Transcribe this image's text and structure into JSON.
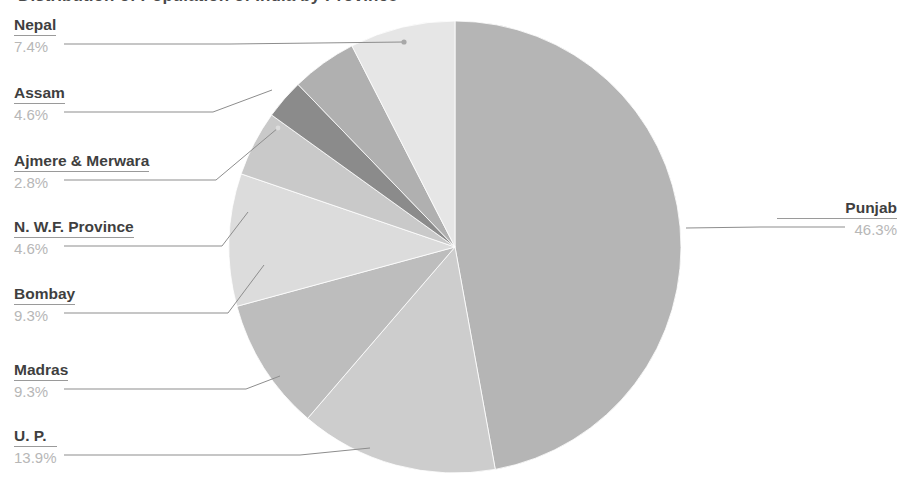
{
  "chart_data": {
    "type": "pie",
    "title": "Distribution of Population of India by Province",
    "xlabel": "",
    "ylabel": "",
    "legend_position": "none",
    "grid": false,
    "start_angle_deg": 0,
    "direction": "clockwise",
    "categories": [
      "Punjab",
      "U. P.",
      "Madras",
      "Bombay",
      "N. W.F. Province",
      "Ajmere & Merwara",
      "Assam",
      "Nepal"
    ],
    "values": [
      46.3,
      13.9,
      9.3,
      9.3,
      4.6,
      2.8,
      4.6,
      7.4
    ],
    "value_labels": [
      "46.3%",
      "13.9%",
      "9.3%",
      "9.3%",
      "4.6%",
      "2.8%",
      "4.6%",
      "7.4%"
    ],
    "unit": "%",
    "slice_colors": [
      "#b5b5b5",
      "#cdcdcd",
      "#bdbdbd",
      "#dcdcdc",
      "#c9c9c9",
      "#8b8b8b",
      "#b0b0b0",
      "#e6e6e6"
    ]
  },
  "chart": {
    "title": "Distribution of Population of India by Province",
    "center_x": 455,
    "center_y": 247,
    "radius": 226
  },
  "callouts": [
    {
      "name": "nepal",
      "category": "Nepal",
      "percent": "7.4%"
    },
    {
      "name": "assam",
      "category": "Assam",
      "percent": "4.6%"
    },
    {
      "name": "ajmere",
      "category": "Ajmere & Merwara",
      "percent": "2.8%"
    },
    {
      "name": "nwf",
      "category": "N. W.F. Province",
      "percent": "4.6%"
    },
    {
      "name": "bombay",
      "category": "Bombay",
      "percent": "9.3%"
    },
    {
      "name": "madras",
      "category": "Madras",
      "percent": "9.3%"
    },
    {
      "name": "up",
      "category": "U. P.",
      "percent": "13.9%"
    },
    {
      "name": "punjab",
      "category": "Punjab",
      "percent": "46.3%"
    }
  ]
}
